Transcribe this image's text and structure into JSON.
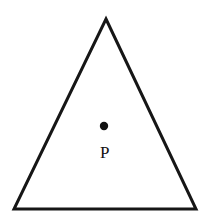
{
  "figure": {
    "kind": "geometry-diagram",
    "canvas": {
      "width": 208,
      "height": 224,
      "background_color": "#FFFFFF"
    },
    "shapes": {
      "triangle": {
        "name": "triangle",
        "stroke_color": "#161616",
        "stroke_width": 3,
        "fill": "none",
        "points_attr": "106,19 196,209 14,209",
        "vertices": [
          {
            "name": "apex",
            "x": 106,
            "y": 19
          },
          {
            "name": "bottom-right",
            "x": 196,
            "y": 209
          },
          {
            "name": "bottom-left",
            "x": 14,
            "y": 209
          }
        ]
      },
      "interior_point": {
        "name": "point-P",
        "cx": 104,
        "cy": 126,
        "r": 4.2,
        "fill_color": "#111111"
      }
    },
    "labels": {
      "point_p": {
        "text": "P",
        "x": 100,
        "y": 144,
        "font_size_px": 17,
        "color": "#111111"
      }
    }
  }
}
